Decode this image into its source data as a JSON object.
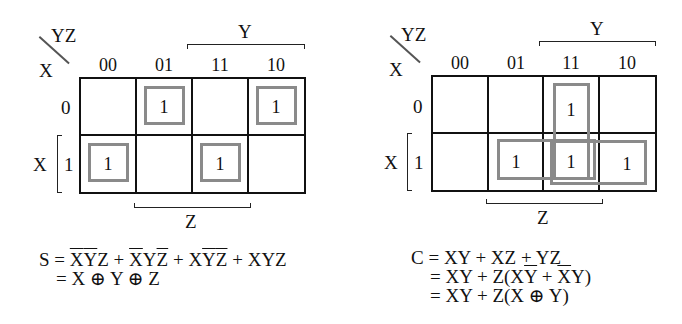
{
  "maps": [
    {
      "id": "sum",
      "corner": {
        "row_var": "X",
        "col_vars": "YZ"
      },
      "col_headers": [
        "00",
        "01",
        "11",
        "10"
      ],
      "row_headers": [
        "0",
        "1"
      ],
      "col_bracket_label": "Y",
      "row_bracket_label": "X",
      "bottom_bracket_label": "Z",
      "cells": [
        [
          "",
          "1",
          "",
          "1"
        ],
        [
          "1",
          "",
          "1",
          ""
        ]
      ],
      "groups": [
        "X'Y'Z",
        "X'YZ'",
        "XY'Z'",
        "XYZ"
      ]
    },
    {
      "id": "carry",
      "corner": {
        "row_var": "X",
        "col_vars": "YZ"
      },
      "col_headers": [
        "00",
        "01",
        "11",
        "10"
      ],
      "row_headers": [
        "0",
        "1"
      ],
      "col_bracket_label": "Y",
      "row_bracket_label": "X",
      "bottom_bracket_label": "Z",
      "cells": [
        [
          "",
          "",
          "1",
          ""
        ],
        [
          "",
          "1",
          "1",
          "1"
        ]
      ],
      "groups": [
        "YZ",
        "XZ",
        "XY"
      ]
    }
  ],
  "equations": {
    "sum": {
      "lhs": "S",
      "line1": {
        "t1": "XYZ",
        "t2": "XYZ",
        "t3": "XYZ",
        "t4": "XYZ"
      },
      "line2": "= X ⊕ Y ⊕ Z"
    },
    "carry": {
      "line1": "C = XY + XZ + YZ",
      "line2_prefix": "= XY + Z(X",
      "line2_y": "Y",
      "line2_mid": " + ",
      "line2_x": "X",
      "line2_suffix": "Y)",
      "line3": "= XY + Z(X ⊕ Y)"
    }
  },
  "colors": {
    "grid": "#111111",
    "group_outline": "#8a8a8a",
    "background": "#ffffff"
  }
}
